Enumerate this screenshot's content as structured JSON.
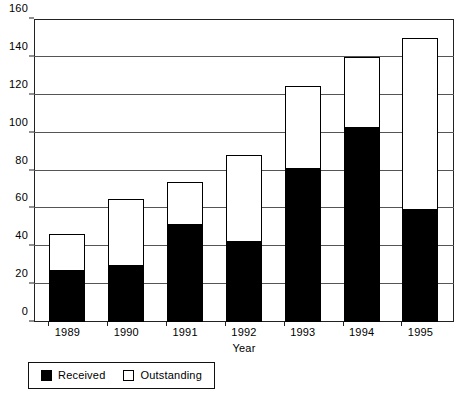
{
  "chart_data": {
    "type": "bar",
    "subtype": "stacked-vertical-bar",
    "title": "",
    "xlabel": "Year",
    "ylabel": "",
    "categories": [
      "1989",
      "1990",
      "1991",
      "1992",
      "1993",
      "1994",
      "1995"
    ],
    "series": [
      {
        "name": "Received",
        "color": "#000000",
        "values": [
          28,
          30.5,
          52,
          43,
          81.5,
          103.5,
          60
        ]
      },
      {
        "name": "Outstanding",
        "color": "#ffffff",
        "values": [
          18.5,
          34.5,
          22,
          45,
          43,
          36.5,
          90
        ]
      }
    ],
    "totals": [
      46.5,
      65,
      74,
      88,
      124.5,
      140,
      150
    ],
    "ylim": [
      0,
      160
    ],
    "ytick_step": 20,
    "yticks": [
      0,
      20,
      40,
      60,
      80,
      100,
      120,
      140,
      160
    ],
    "ytick_labels": [
      "0",
      "20",
      "40",
      "60",
      "80",
      "100",
      "120",
      "140",
      "160"
    ],
    "grid": "horizontal",
    "legend_position": "bottom-left",
    "legend_entries": [
      "Received",
      "Outstanding"
    ],
    "frame": "box"
  },
  "axes": {
    "x_title": "Year"
  },
  "legend": {
    "items": [
      {
        "label": "Received",
        "swatch": "black-filled-square"
      },
      {
        "label": "Outstanding",
        "swatch": "white-outlined-square"
      }
    ]
  },
  "colors": {
    "received": "#000000",
    "outstanding": "#ffffff",
    "gridline": "#555555",
    "frame": "#222222",
    "background": "#ffffff"
  }
}
